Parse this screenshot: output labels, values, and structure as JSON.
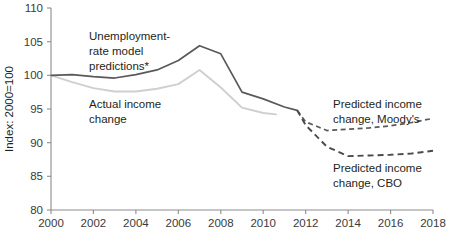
{
  "chart_data": {
    "type": "line",
    "title": "",
    "xlabel": "",
    "ylabel": "Index: 2000=100",
    "xlim": [
      2000,
      2018
    ],
    "ylim": [
      80,
      110
    ],
    "grid": false,
    "legend_position": "inline-annotations",
    "xticks": [
      "2000",
      "2002",
      "2004",
      "2006",
      "2008",
      "2010",
      "2012",
      "2014",
      "2016",
      "2018"
    ],
    "yticks": [
      "80",
      "85",
      "90",
      "95",
      "100",
      "105",
      "110"
    ],
    "annotations": [
      {
        "id": "unemployment-label",
        "text_lines": [
          "Unemployment-",
          "rate model",
          "predictions*"
        ]
      },
      {
        "id": "actual-label",
        "text_lines": [
          "Actual income",
          "change"
        ]
      },
      {
        "id": "moodys-label",
        "text_lines": [
          "Predicted income",
          "change, Moody's"
        ]
      },
      {
        "id": "cbo-label",
        "text_lines": [
          "Predicted income",
          "change, CBO"
        ]
      }
    ],
    "series": [
      {
        "name": "Unemployment-rate model predictions*",
        "style": "solid",
        "color": "#595959",
        "x": [
          2000,
          2001,
          2002,
          2003,
          2004,
          2005,
          2006,
          2007,
          2008,
          2009,
          2010,
          2011,
          2011.6
        ],
        "values": [
          100.0,
          100.1,
          99.8,
          99.6,
          100.1,
          100.8,
          102.2,
          104.4,
          103.2,
          97.5,
          96.5,
          95.3,
          94.8
        ]
      },
      {
        "name": "Actual income change",
        "style": "solid",
        "color": "#cfcfcf",
        "x": [
          2000,
          2001,
          2002,
          2003,
          2004,
          2005,
          2006,
          2007,
          2008,
          2009,
          2010,
          2010.6
        ],
        "values": [
          100.0,
          99.0,
          98.1,
          97.6,
          97.6,
          98.0,
          98.7,
          100.8,
          98.2,
          95.2,
          94.4,
          94.2
        ]
      },
      {
        "name": "Predicted income change, Moody's",
        "style": "dashed",
        "color": "#5a5a5a",
        "x": [
          2011.6,
          2012,
          2013,
          2014,
          2015,
          2016,
          2017,
          2018
        ],
        "values": [
          94.8,
          93.1,
          91.8,
          92.0,
          92.2,
          92.5,
          93.0,
          93.6
        ]
      },
      {
        "name": "Predicted income change, CBO",
        "style": "dashed",
        "color": "#4a4a4a",
        "x": [
          2011.6,
          2012,
          2013,
          2014,
          2015,
          2016,
          2017,
          2018
        ],
        "values": [
          94.8,
          92.6,
          89.4,
          88.0,
          88.1,
          88.2,
          88.4,
          88.8
        ]
      }
    ]
  },
  "axes": {
    "y_title": "Index: 2000=100",
    "y_ticks": {
      "t0": "80",
      "t1": "85",
      "t2": "90",
      "t3": "95",
      "t4": "100",
      "t5": "105",
      "t6": "110"
    },
    "x_ticks": {
      "t0": "2000",
      "t1": "2002",
      "t2": "2004",
      "t3": "2006",
      "t4": "2008",
      "t5": "2010",
      "t6": "2012",
      "t7": "2014",
      "t8": "2016",
      "t9": "2018"
    }
  },
  "labels": {
    "unemployment": {
      "line1": "Unemployment-",
      "line2": "rate model",
      "line3": "predictions*"
    },
    "actual": {
      "line1": "Actual income",
      "line2": "change"
    },
    "moodys": {
      "line1": "Predicted income",
      "line2": "change, Moody's"
    },
    "cbo": {
      "line1": "Predicted income",
      "line2": "change, CBO"
    }
  },
  "colors": {
    "solid_dark": "#595959",
    "light_gray": "#cfcfcf",
    "dashed_dark": "#4a4a4a",
    "axis": "#8c8c8c",
    "text": "#231f20"
  }
}
